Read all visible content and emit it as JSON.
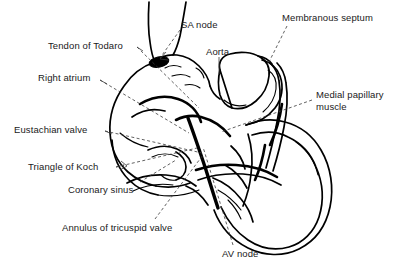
{
  "figure": {
    "background_color": "#ffffff",
    "line_color": "#000000",
    "label_color": "#1a1a1a",
    "width": 393,
    "height": 265
  },
  "labels": [
    {
      "id": "tendon-of-todaro",
      "text": "Tendon of Todaro",
      "x": 48,
      "y": 40
    },
    {
      "id": "right-atrium",
      "text": "Right atrium",
      "x": 38,
      "y": 72
    },
    {
      "id": "eustachian-valve",
      "text": "Eustachian valve",
      "x": 14,
      "y": 124
    },
    {
      "id": "triangle-of-koch",
      "text": "Triangle of Koch",
      "x": 28,
      "y": 161
    },
    {
      "id": "coronary-sinus",
      "text": "Coronary sinus",
      "x": 68,
      "y": 184
    },
    {
      "id": "annulus-of-tricuspid-valve",
      "text": "Annulus of tricuspid valve",
      "x": 62,
      "y": 222
    },
    {
      "id": "sa-node",
      "text": "SA node",
      "x": 181,
      "y": 19
    },
    {
      "id": "aorta",
      "text": "Aorta",
      "x": 206,
      "y": 46
    },
    {
      "id": "membranous-septum",
      "text": "Membranous septum",
      "x": 282,
      "y": 12
    },
    {
      "id": "medial-papillary-muscle",
      "text": "Medial papillary muscle",
      "x": 316,
      "y": 89
    },
    {
      "id": "av-node",
      "text": "AV node",
      "x": 222,
      "y": 248
    }
  ],
  "structures": [
    {
      "id": "superior-vena-cava",
      "name": "Superior vena cava"
    },
    {
      "id": "right-atrial-wall",
      "name": "Right atrial wall"
    },
    {
      "id": "sa-node-marker",
      "name": "SA node marker",
      "shape": "filled-ellipse",
      "color": "#000000"
    },
    {
      "id": "aortic-root",
      "name": "Aortic root"
    },
    {
      "id": "membranous-septum-band",
      "name": "Membranous septum band"
    },
    {
      "id": "right-ventricle-wall",
      "name": "Right ventricle wall"
    },
    {
      "id": "tricuspid-annulus-line",
      "name": "Tricuspid annulus line"
    },
    {
      "id": "coronary-sinus-ostium",
      "name": "Coronary sinus ostium"
    },
    {
      "id": "eustachian-valve-ridge",
      "name": "Eustachian valve ridge"
    },
    {
      "id": "papillary-muscles",
      "name": "Papillary muscles and trabeculae"
    }
  ]
}
